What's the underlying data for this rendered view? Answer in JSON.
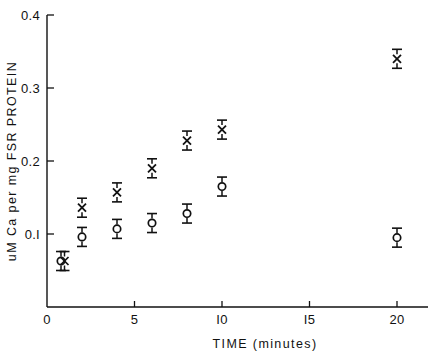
{
  "chart_data": {
    "type": "scatter",
    "title": "",
    "xlabel": "TIME  (minutes)",
    "ylabel": "uM Ca per mg FSR PROTEIN",
    "xlim": [
      0,
      21.6
    ],
    "ylim": [
      0,
      0.4
    ],
    "grid": false,
    "legend_position": "none",
    "xticks": [
      0,
      5,
      10,
      15,
      20
    ],
    "xtick_labels": [
      "0",
      "5",
      "I0",
      "I5",
      "20"
    ],
    "yticks": [
      0.1,
      0.2,
      0.3,
      0.4
    ],
    "ytick_labels": [
      "0.I",
      "0.2",
      "0.3",
      "0.4"
    ],
    "marker_style": "error-bar-with-symbol",
    "series": [
      {
        "name": "X series",
        "symbol": "X",
        "points": [
          {
            "x": 1.0,
            "y": 0.063,
            "err": 0.013
          },
          {
            "x": 2.0,
            "y": 0.136,
            "err": 0.013
          },
          {
            "x": 4.0,
            "y": 0.157,
            "err": 0.013
          },
          {
            "x": 6.0,
            "y": 0.19,
            "err": 0.013
          },
          {
            "x": 8.0,
            "y": 0.228,
            "err": 0.013
          },
          {
            "x": 10.0,
            "y": 0.243,
            "err": 0.013
          },
          {
            "x": 20.0,
            "y": 0.34,
            "err": 0.013
          }
        ]
      },
      {
        "name": "O series",
        "symbol": "O",
        "points": [
          {
            "x": 0.8,
            "y": 0.063,
            "err": 0.013
          },
          {
            "x": 2.0,
            "y": 0.096,
            "err": 0.013
          },
          {
            "x": 4.0,
            "y": 0.107,
            "err": 0.013
          },
          {
            "x": 6.0,
            "y": 0.115,
            "err": 0.013
          },
          {
            "x": 8.0,
            "y": 0.128,
            "err": 0.013
          },
          {
            "x": 10.0,
            "y": 0.165,
            "err": 0.013
          },
          {
            "x": 20.0,
            "y": 0.095,
            "err": 0.013
          }
        ]
      }
    ]
  },
  "colors": {
    "ink": "#111111",
    "background": "#ffffff"
  }
}
